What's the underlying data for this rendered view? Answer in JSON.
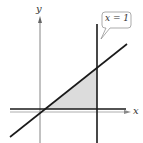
{
  "diagram": {
    "axes": {
      "x_label": "x",
      "y_label": "y"
    },
    "callout": {
      "text": "x = 1"
    },
    "elements": [
      {
        "type": "line",
        "description": "diagonal line through origin region"
      },
      {
        "type": "line",
        "description": "horizontal line slightly above x-axis"
      },
      {
        "type": "line",
        "description": "vertical line x = 1"
      },
      {
        "type": "region",
        "description": "shaded triangular region bounded by the three lines"
      }
    ],
    "colors": {
      "line": "#1a1a1a",
      "axis": "#555555",
      "shade": "#d9d9d9",
      "callout_border": "#888888"
    }
  }
}
